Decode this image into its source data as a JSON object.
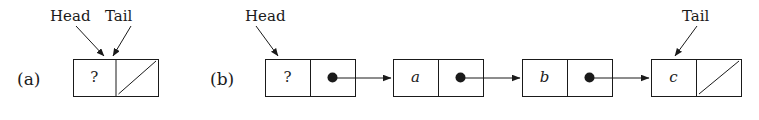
{
  "figure": {
    "background_color": "#ffffff",
    "stroke_color": "#1a1a1a",
    "panels": [
      {
        "id": "a",
        "label": "(a)",
        "label_x": 17,
        "label_y": 71,
        "caption_meaning": "empty list",
        "pointer_labels": [
          {
            "name": "head",
            "text": "Head",
            "x": 50,
            "y": 9,
            "arrow": {
              "x1": 76,
              "y1": 26,
              "x2": 104,
              "y2": 56
            }
          },
          {
            "name": "tail",
            "text": "Tail",
            "x": 105,
            "y": 9,
            "arrow": {
              "x1": 131,
              "y1": 26,
              "x2": 113,
              "y2": 56
            }
          }
        ],
        "nodes": [
          {
            "name": "sentinel-node",
            "x": 73,
            "y": 59,
            "width": 85,
            "height": 37,
            "data_cell": {
              "text": "?",
              "italic": false
            },
            "next_cell": {
              "text": "",
              "null_slash": true
            }
          }
        ],
        "links": []
      },
      {
        "id": "b",
        "label": "(b)",
        "label_x": 210,
        "label_y": 71,
        "caption_meaning": "list containing a, b, c",
        "pointer_labels": [
          {
            "name": "head",
            "text": "Head",
            "x": 245,
            "y": 9,
            "arrow": {
              "x1": 256,
              "y1": 26,
              "x2": 278,
              "y2": 56
            }
          },
          {
            "name": "tail",
            "text": "Tail",
            "x": 682,
            "y": 9,
            "arrow": {
              "x1": 697,
              "y1": 26,
              "x2": 675,
              "y2": 56
            }
          }
        ],
        "nodes": [
          {
            "name": "sentinel-node",
            "x": 265,
            "y": 59,
            "width": 90,
            "height": 37,
            "data_cell": {
              "text": "?",
              "italic": false
            },
            "next_cell": {
              "text": "",
              "null_slash": false,
              "pointer_dot": true
            }
          },
          {
            "name": "node-a",
            "x": 393,
            "y": 59,
            "width": 90,
            "height": 37,
            "data_cell": {
              "text": "a",
              "italic": true
            },
            "next_cell": {
              "text": "",
              "null_slash": false,
              "pointer_dot": true
            }
          },
          {
            "name": "node-b",
            "x": 522,
            "y": 59,
            "width": 90,
            "height": 37,
            "data_cell": {
              "text": "b",
              "italic": true
            },
            "next_cell": {
              "text": "",
              "null_slash": false,
              "pointer_dot": true
            }
          },
          {
            "name": "node-c",
            "x": 651,
            "y": 59,
            "width": 90,
            "height": 37,
            "data_cell": {
              "text": "c",
              "italic": true
            },
            "next_cell": {
              "text": "",
              "null_slash": true
            }
          }
        ],
        "links": [
          {
            "name": "link-sentinel-to-a",
            "x1": 332,
            "y1": 78,
            "x2": 391,
            "y2": 78
          },
          {
            "name": "link-a-to-b",
            "x1": 461,
            "y1": 78,
            "x2": 520,
            "y2": 78
          },
          {
            "name": "link-b-to-c",
            "x1": 590,
            "y1": 78,
            "x2": 649,
            "y2": 78
          }
        ]
      }
    ]
  }
}
